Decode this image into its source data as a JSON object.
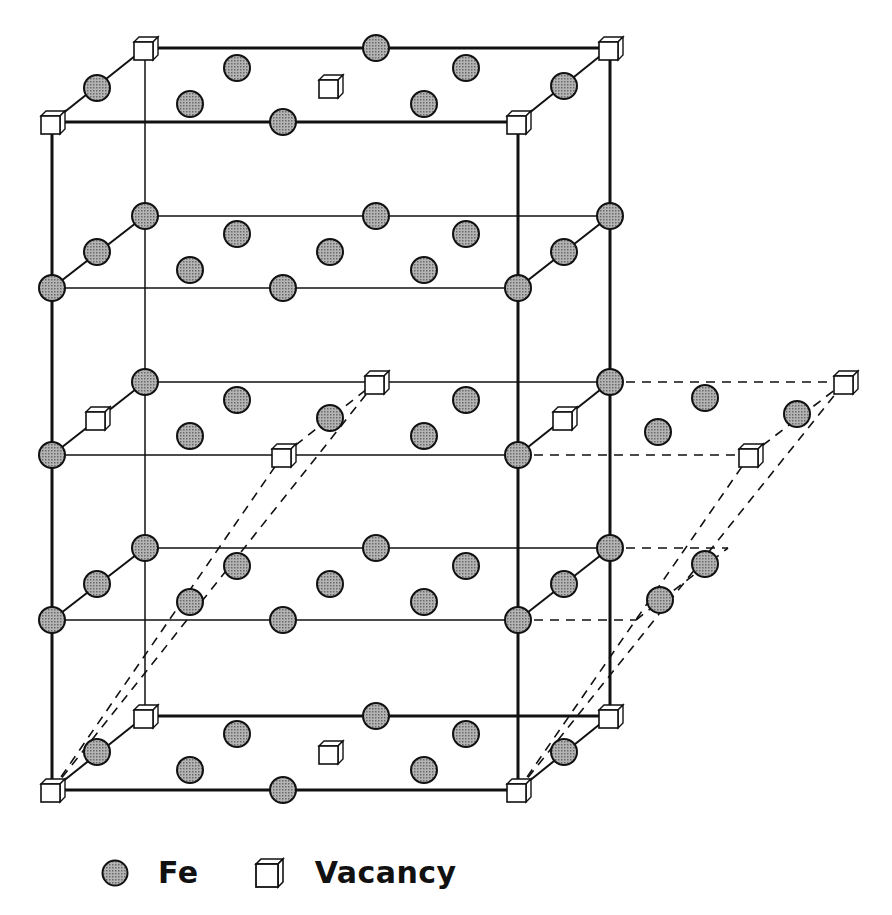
{
  "legend": {
    "fe_label": "Fe",
    "vacancy_label": "Vacancy"
  },
  "colors": {
    "atom_fill": "#9a9a9a",
    "stroke": "#111111",
    "vacancy_fill": "#ffffff",
    "background": "#ffffff"
  },
  "box": {
    "front_left_x": 52,
    "front_right_x": 518,
    "back_left_x": 145,
    "back_right_x": 610,
    "front_top_y": 122,
    "back_top_y": 48,
    "front_bottom_y": 790,
    "back_bottom_y": 716
  },
  "layers": [
    {
      "name": "top",
      "front_y": 122,
      "back_y": 48
    },
    {
      "name": "layer-2",
      "front_y": 288,
      "back_y": 216
    },
    {
      "name": "layer-3",
      "front_y": 455,
      "back_y": 382
    },
    {
      "name": "layer-4",
      "front_y": 620,
      "back_y": 548
    },
    {
      "name": "bottom",
      "front_y": 790,
      "back_y": 716
    }
  ],
  "fe_atoms": [
    [
      97,
      88
    ],
    [
      376,
      48
    ],
    [
      237,
      68
    ],
    [
      466,
      68
    ],
    [
      190,
      104
    ],
    [
      424,
      104
    ],
    [
      283,
      122
    ],
    [
      564,
      86
    ],
    [
      145,
      216
    ],
    [
      376,
      216
    ],
    [
      610,
      216
    ],
    [
      97,
      252
    ],
    [
      237,
      234
    ],
    [
      330,
      252
    ],
    [
      466,
      234
    ],
    [
      564,
      252
    ],
    [
      190,
      270
    ],
    [
      424,
      270
    ],
    [
      52,
      288
    ],
    [
      283,
      288
    ],
    [
      518,
      288
    ],
    [
      145,
      382
    ],
    [
      610,
      382
    ],
    [
      237,
      400
    ],
    [
      466,
      400
    ],
    [
      330,
      418
    ],
    [
      190,
      436
    ],
    [
      424,
      436
    ],
    [
      52,
      455
    ],
    [
      518,
      455
    ],
    [
      705,
      398
    ],
    [
      797,
      414
    ],
    [
      658,
      432
    ],
    [
      145,
      548
    ],
    [
      376,
      548
    ],
    [
      610,
      548
    ],
    [
      97,
      584
    ],
    [
      237,
      566
    ],
    [
      330,
      584
    ],
    [
      466,
      566
    ],
    [
      564,
      584
    ],
    [
      190,
      602
    ],
    [
      424,
      602
    ],
    [
      52,
      620
    ],
    [
      283,
      620
    ],
    [
      518,
      620
    ],
    [
      705,
      564
    ],
    [
      660,
      600
    ],
    [
      376,
      716
    ],
    [
      97,
      752
    ],
    [
      237,
      734
    ],
    [
      466,
      734
    ],
    [
      190,
      770
    ],
    [
      424,
      770
    ],
    [
      283,
      790
    ],
    [
      564,
      752
    ]
  ],
  "vacancies": [
    [
      145,
      48
    ],
    [
      610,
      48
    ],
    [
      52,
      122
    ],
    [
      518,
      122
    ],
    [
      330,
      86
    ],
    [
      97,
      418
    ],
    [
      376,
      382
    ],
    [
      283,
      455
    ],
    [
      564,
      418
    ],
    [
      845,
      382
    ],
    [
      750,
      455
    ],
    [
      145,
      716
    ],
    [
      610,
      716
    ],
    [
      52,
      790
    ],
    [
      518,
      790
    ],
    [
      330,
      752
    ]
  ]
}
